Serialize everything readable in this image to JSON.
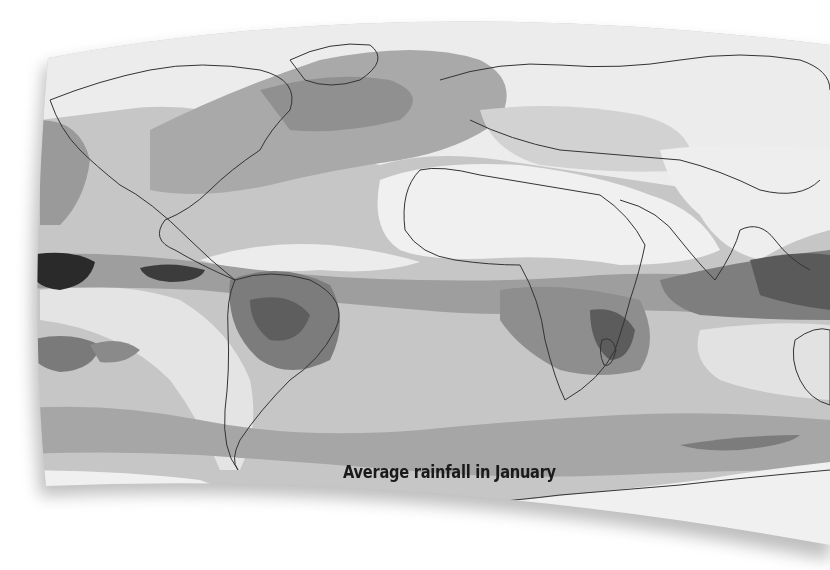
{
  "map": {
    "caption": "Average rainfall in January",
    "type": "world-choropleth",
    "color_scale": "grayscale",
    "colors": {
      "lightest": "#f2f2f2",
      "light": "#dcdcdc",
      "medium_light": "#c4c4c4",
      "medium": "#a8a8a8",
      "dark": "#8a8a8a",
      "darker": "#5e5e5e",
      "darkest": "#1e1e1e",
      "coastline": "#333333"
    }
  }
}
